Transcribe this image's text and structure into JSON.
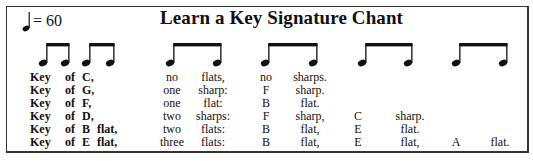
{
  "title": "Learn a Key Signature Chant",
  "tempo": {
    "icon": "quarter-note-icon",
    "text": "= 60"
  },
  "beams": [
    {
      "x1": 43,
      "x2": 65
    },
    {
      "x1": 86,
      "x2": 110
    },
    {
      "x1": 170,
      "x2": 217
    },
    {
      "x1": 265,
      "x2": 313
    },
    {
      "x1": 362,
      "x2": 408
    },
    {
      "x1": 456,
      "x2": 503
    }
  ],
  "rows": [
    {
      "key": "Key",
      "of": "of",
      "letter": "C,",
      "accidental": "",
      "count": "no",
      "kind": "flats,",
      "n1": "no",
      "n1k": "sharps.",
      "n2": "",
      "n2k": "",
      "n3": "",
      "n3k": ""
    },
    {
      "key": "Key",
      "of": "of",
      "letter": "G,",
      "accidental": "",
      "count": "one",
      "kind": "sharp:",
      "n1": "F",
      "n1k": "sharp.",
      "n2": "",
      "n2k": "",
      "n3": "",
      "n3k": ""
    },
    {
      "key": "Key",
      "of": "of",
      "letter": "F,",
      "accidental": "",
      "count": "one",
      "kind": "flat:",
      "n1": "B",
      "n1k": "flat.",
      "n2": "",
      "n2k": "",
      "n3": "",
      "n3k": ""
    },
    {
      "key": "Key",
      "of": "of",
      "letter": "D,",
      "accidental": "",
      "count": "two",
      "kind": "sharps:",
      "n1": "F",
      "n1k": "sharp,",
      "n2": "C",
      "n2k": "sharp.",
      "n3": "",
      "n3k": ""
    },
    {
      "key": "Key",
      "of": "of",
      "letter": "B",
      "accidental": "flat,",
      "count": "two",
      "kind": "flats:",
      "n1": "B",
      "n1k": "flat,",
      "n2": "E",
      "n2k": "flat.",
      "n3": "",
      "n3k": ""
    },
    {
      "key": "Key",
      "of": "of",
      "letter": "E",
      "accidental": "flat,",
      "count": "three",
      "kind": "flats:",
      "n1": "B",
      "n1k": "flat,",
      "n2": "E",
      "n2k": "flat,",
      "n3": "A",
      "n3k": "flat."
    }
  ]
}
